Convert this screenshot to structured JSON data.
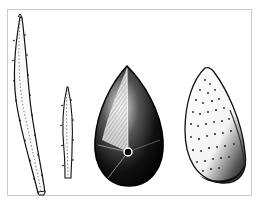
{
  "figure": {
    "colors": {
      "ink": "#111111",
      "paper": "#ffffff",
      "frame": "#c9c9c9"
    },
    "items": [
      {
        "id": "long-bract",
        "label": "long spiny bract"
      },
      {
        "id": "short-bract",
        "label": "short spiny bract"
      },
      {
        "id": "dark-seed",
        "label": "seed, dark view with hilum"
      },
      {
        "id": "pitted-seed",
        "label": "seed, pitted surface view"
      }
    ]
  }
}
